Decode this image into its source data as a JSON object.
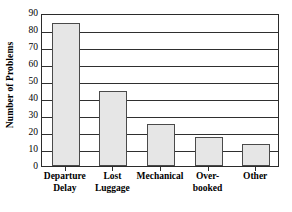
{
  "chart_data": {
    "type": "bar",
    "title": "",
    "subtitle": "",
    "xlabel": "",
    "ylabel": "Number of Problems",
    "categories": [
      "Departure Delay",
      "Lost Luggage",
      "Mechanical",
      "Over-booked",
      "Other"
    ],
    "category_lines": [
      [
        "Departure",
        "Delay"
      ],
      [
        "Lost",
        "Luggage"
      ],
      [
        "Mechanical",
        ""
      ],
      [
        "Over-",
        "booked"
      ],
      [
        "Other",
        ""
      ]
    ],
    "values": [
      84,
      44,
      25,
      17,
      13
    ],
    "ylim": [
      0,
      90
    ],
    "ytick_step": 10,
    "ytick_labels": [
      "90",
      "80",
      "70",
      "60",
      "50",
      "40",
      "30",
      "20",
      "10",
      "0"
    ],
    "ytick_values": [
      90,
      80,
      70,
      60,
      50,
      40,
      30,
      20,
      10,
      0
    ],
    "grid": "horizontal",
    "legend": "none",
    "colors": {
      "bar_fill": "#e6e6e6",
      "bar_border": "#4a4a4a",
      "axis": "#2b2b2b",
      "grid": "#2f2f2f",
      "text": "#000000",
      "background": "#ffffff"
    }
  }
}
